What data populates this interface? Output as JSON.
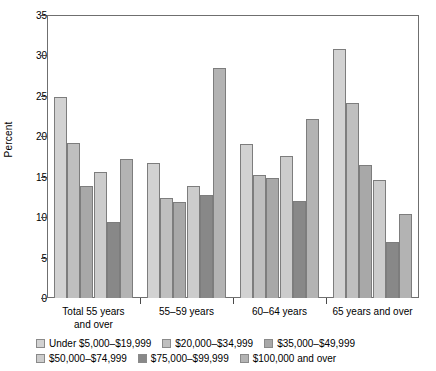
{
  "chart_data": {
    "type": "bar",
    "title": "",
    "xlabel": "",
    "ylabel": "Percent",
    "ylim": [
      0,
      35
    ],
    "ytick_step": 5,
    "yticks": [
      "0",
      "5",
      "10",
      "15",
      "20",
      "25",
      "30",
      "35"
    ],
    "grid": false,
    "legend_position": "bottom",
    "categories": [
      "Total 55 years and over",
      "55–59 years",
      "60–64 years",
      "65 years and over"
    ],
    "category_lines": [
      [
        "Total 55 years",
        "and over"
      ],
      [
        "55–59 years"
      ],
      [
        "60–64 years"
      ],
      [
        "65 years and over"
      ]
    ],
    "series": [
      {
        "name": "Under $5,000–$19,999",
        "color": "#d2d2d2",
        "values": [
          24.8,
          16.7,
          19.1,
          30.8
        ]
      },
      {
        "name": "$20,000–$34,999",
        "color": "#bfbfbf",
        "values": [
          19.2,
          12.4,
          15.2,
          24.1
        ]
      },
      {
        "name": "$35,000–$49,999",
        "color": "#a8a8a8",
        "values": [
          13.9,
          11.9,
          14.9,
          16.4
        ]
      },
      {
        "name": "$50,000–$74,999",
        "color": "#cccccc",
        "values": [
          15.6,
          13.8,
          17.6,
          14.6
        ]
      },
      {
        "name": "$75,000–$99,999",
        "color": "#888888",
        "values": [
          9.4,
          12.8,
          12.0,
          6.9
        ]
      },
      {
        "name": "$100,000 and over",
        "color": "#b3b3b3",
        "values": [
          17.2,
          28.4,
          22.1,
          10.4
        ]
      }
    ]
  },
  "legend": {
    "row1": [
      {
        "label": "Under $5,000–$19,999",
        "color": "#d2d2d2"
      },
      {
        "label": "$20,000–$34,999",
        "color": "#bfbfbf"
      },
      {
        "label": "$35,000–$49,999",
        "color": "#a8a8a8"
      }
    ],
    "row2": [
      {
        "label": "$50,000–$74,999",
        "color": "#cccccc"
      },
      {
        "label": "$75,000–$99,999",
        "color": "#888888"
      },
      {
        "label": "$100,000 and over",
        "color": "#b3b3b3"
      }
    ]
  }
}
